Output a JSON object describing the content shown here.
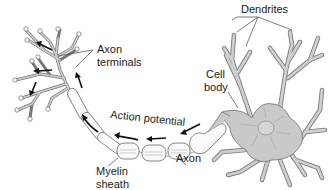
{
  "diagram": {
    "labels": {
      "dendrites": "Dendrites",
      "axon_terminals_line1": "Axon",
      "axon_terminals_line2": "terminals",
      "cell_body_line1": "Cell",
      "cell_body_line2": "body",
      "action_potential": "Action potential",
      "myelin_sheath_line1": "Myelin",
      "myelin_sheath_line2": "sheath",
      "axon": "Axon"
    },
    "colors": {
      "background": "#ffffff",
      "cell_fill": "#c9c9c9",
      "outline": "#6e6e6e",
      "arrow": "#111111",
      "text": "#222222"
    }
  }
}
